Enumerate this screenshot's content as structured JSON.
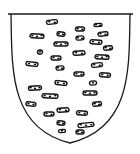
{
  "figure": {
    "background": "#ffffff",
    "shield": {
      "field_color": "#ffffff",
      "outline_color": "#1a1a1a",
      "outline_width": 1.3,
      "top_left": [
        11,
        14
      ],
      "top_right": [
        130,
        14
      ],
      "bottom_tip": [
        70,
        143
      ]
    },
    "billets": {
      "color": "#111111",
      "items": [
        {
          "x": 52,
          "y": 22,
          "w": 11,
          "h": 4
        },
        {
          "x": 98,
          "y": 25,
          "w": 8,
          "h": 3
        },
        {
          "x": 80,
          "y": 29,
          "w": 9,
          "h": 4
        },
        {
          "x": 37,
          "y": 36,
          "w": 14,
          "h": 4
        },
        {
          "x": 61,
          "y": 34,
          "w": 8,
          "h": 4
        },
        {
          "x": 103,
          "y": 34,
          "w": 10,
          "h": 4
        },
        {
          "x": 80,
          "y": 38,
          "w": 8,
          "h": 4
        },
        {
          "x": 61,
          "y": 44,
          "w": 14,
          "h": 4
        },
        {
          "x": 96,
          "y": 42,
          "w": 12,
          "h": 4
        },
        {
          "x": 40,
          "y": 52,
          "w": 5,
          "h": 4
        },
        {
          "x": 108,
          "y": 48,
          "w": 9,
          "h": 4
        },
        {
          "x": 79,
          "y": 53,
          "w": 12,
          "h": 4
        },
        {
          "x": 56,
          "y": 58,
          "w": 10,
          "h": 4
        },
        {
          "x": 102,
          "y": 57,
          "w": 14,
          "h": 4
        },
        {
          "x": 32,
          "y": 64,
          "w": 12,
          "h": 4
        },
        {
          "x": 97,
          "y": 65,
          "w": 11,
          "h": 4
        },
        {
          "x": 60,
          "y": 68,
          "w": 8,
          "h": 4
        },
        {
          "x": 79,
          "y": 74,
          "w": 10,
          "h": 4
        },
        {
          "x": 105,
          "y": 75,
          "w": 11,
          "h": 4
        },
        {
          "x": 61,
          "y": 83,
          "w": 12,
          "h": 4
        },
        {
          "x": 93,
          "y": 83,
          "w": 7,
          "h": 4
        },
        {
          "x": 35,
          "y": 88,
          "w": 13,
          "h": 4
        },
        {
          "x": 90,
          "y": 93,
          "w": 14,
          "h": 4
        },
        {
          "x": 50,
          "y": 96,
          "w": 16,
          "h": 4
        },
        {
          "x": 31,
          "y": 104,
          "w": 10,
          "h": 4
        },
        {
          "x": 97,
          "y": 104,
          "w": 9,
          "h": 4
        },
        {
          "x": 63,
          "y": 110,
          "w": 12,
          "h": 4
        },
        {
          "x": 49,
          "y": 114,
          "w": 10,
          "h": 4
        },
        {
          "x": 82,
          "y": 113,
          "w": 11,
          "h": 4
        },
        {
          "x": 61,
          "y": 123,
          "w": 8,
          "h": 4
        },
        {
          "x": 86,
          "y": 125,
          "w": 16,
          "h": 4
        },
        {
          "x": 62,
          "y": 131,
          "w": 7,
          "h": 3
        },
        {
          "x": 80,
          "y": 132,
          "w": 8,
          "h": 4
        }
      ]
    }
  }
}
